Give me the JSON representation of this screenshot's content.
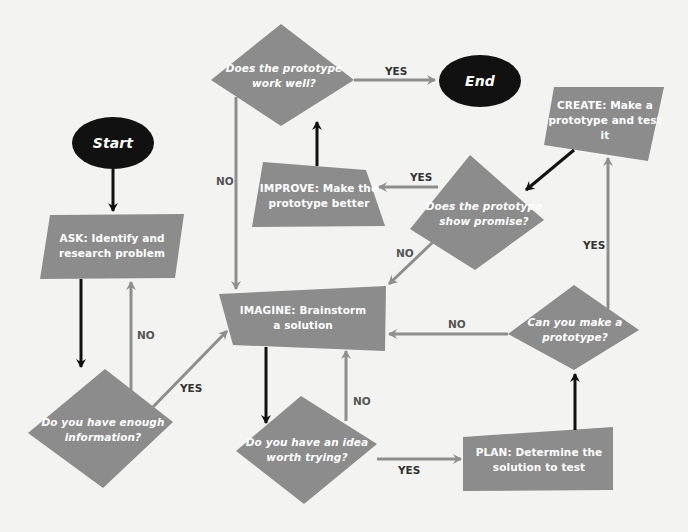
{
  "colors": {
    "background": "#f3f3f1",
    "shape_fill": "#8c8c8c",
    "oval_fill": "#111111",
    "text_on_shape": "#ffffff",
    "main_arrow": "#111111",
    "branch_arrow": "#8e8e8e",
    "label_text": "#555555"
  },
  "terminals": {
    "start": "Start",
    "end": "End"
  },
  "steps": {
    "ask": "ASK: Identify and\nresearch problem",
    "imagine": "IMAGINE: Brainstorm\na solution",
    "plan": "PLAN: Determine the\nsolution to test",
    "create": "CREATE: Make a\nprototype and test it",
    "improve": "IMPROVE: Make the\nprototype better"
  },
  "decisions": {
    "enough_info": "Do you have enough\ninformation?",
    "idea_worth": "Do you have an idea\nworth trying?",
    "can_make": "Can you make a\nprototype?",
    "show_promise": "Does the prototype\nshow promise?",
    "work_well": "Does the prototype\nwork well?"
  },
  "edge_labels": {
    "work_well_yes": "YES",
    "work_well_no": "NO",
    "promise_yes": "YES",
    "promise_no": "NO",
    "enough_info_no": "NO",
    "enough_info_yes": "YES",
    "idea_no": "NO",
    "idea_yes": "YES",
    "can_make_no": "NO",
    "can_make_yes": "YES"
  }
}
